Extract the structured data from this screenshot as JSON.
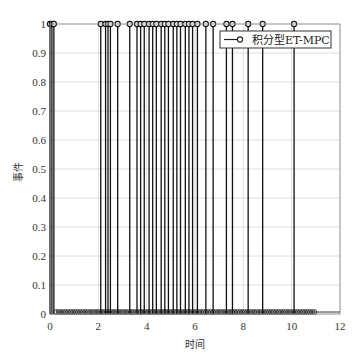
{
  "chart_data": {
    "type": "stem",
    "title": "",
    "xlabel": "时间",
    "ylabel": "事件",
    "xlim": [
      0,
      12
    ],
    "ylim": [
      0,
      1
    ],
    "x_ticks": [
      "0",
      "2",
      "4",
      "6",
      "8",
      "10",
      "12"
    ],
    "y_ticks": [
      "0",
      "0.1",
      "0.2",
      "0.3",
      "0.4",
      "0.5",
      "0.6",
      "0.7",
      "0.8",
      "0.9",
      "1"
    ],
    "grid": true,
    "legend": {
      "position": "upper right",
      "entries": [
        "积分型ET-MPC"
      ]
    },
    "series": [
      {
        "name": "积分型ET-MPC",
        "marker": "circle",
        "event_times": [
          0.0,
          0.08,
          0.16,
          2.1,
          2.3,
          2.4,
          2.5,
          2.8,
          3.3,
          3.6,
          3.75,
          3.9,
          4.1,
          4.25,
          4.4,
          4.6,
          4.75,
          4.9,
          5.1,
          5.25,
          5.4,
          5.6,
          5.75,
          5.9,
          6.1,
          6.45,
          6.75,
          7.3,
          7.55,
          8.2,
          8.8,
          10.1
        ],
        "event_value": 1,
        "non_event_value": 0,
        "sample_range": [
          0.25,
          11.0
        ],
        "sample_step": 0.1
      }
    ]
  }
}
